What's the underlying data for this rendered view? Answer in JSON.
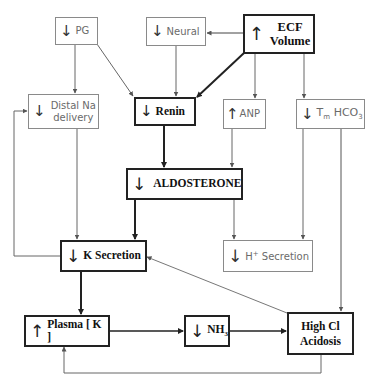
{
  "diagram": {
    "colors": {
      "bold_line": "#222222",
      "thin_line": "#7a7a7a",
      "thin_text": "#6a6a6a",
      "bold_text": "#111111",
      "background": "#ffffff"
    },
    "icons": {
      "arrow_down": "↓",
      "arrow_up": "↑"
    },
    "nodes": {
      "pg": {
        "direction": "down",
        "label": "PG"
      },
      "neural": {
        "direction": "down",
        "label": "Neural"
      },
      "ecf_volume": {
        "direction": "up",
        "label_line1": "ECF",
        "label_line2": "Volume"
      },
      "distal_na": {
        "direction": "down",
        "label_line1": "Distal Na",
        "label_line2": "delivery"
      },
      "renin": {
        "direction": "down",
        "label": "Renin"
      },
      "anp": {
        "direction": "up",
        "label": "ANP"
      },
      "tm_hco3": {
        "direction": "down",
        "label_prefix": "T",
        "label_sub": "m",
        "label_main": " HCO",
        "label_sub2": "3"
      },
      "aldosterone": {
        "direction": "down",
        "label": "ALDOSTERONE"
      },
      "k_secretion": {
        "direction": "down",
        "label": "K Secretion"
      },
      "h_secretion": {
        "direction": "down",
        "label_prefix": "H",
        "label_sup": "+",
        "label_main": " Secretion"
      },
      "plasma_k": {
        "direction": "up",
        "label": "Plasma [ K ]"
      },
      "nh3": {
        "direction": "down",
        "label_main": "NH",
        "label_sub": "3"
      },
      "high_cl_acidosis": {
        "label_line1": "High Cl",
        "label_line2": "Acidosis"
      }
    },
    "edges": [
      {
        "from": "ecf_volume",
        "to": "neural"
      },
      {
        "from": "ecf_volume",
        "to": "renin"
      },
      {
        "from": "ecf_volume",
        "to": "anp"
      },
      {
        "from": "ecf_volume",
        "to": "tm_hco3"
      },
      {
        "from": "pg",
        "to": "distal_na"
      },
      {
        "from": "pg",
        "to": "renin"
      },
      {
        "from": "neural",
        "to": "renin"
      },
      {
        "from": "renin",
        "to": "aldosterone"
      },
      {
        "from": "anp",
        "to": "aldosterone"
      },
      {
        "from": "distal_na",
        "to": "k_secretion"
      },
      {
        "from": "aldosterone",
        "to": "k_secretion"
      },
      {
        "from": "aldosterone",
        "to": "h_secretion"
      },
      {
        "from": "tm_hco3",
        "to": "h_secretion"
      },
      {
        "from": "tm_hco3",
        "to": "high_cl_acidosis"
      },
      {
        "from": "k_secretion",
        "to": "distal_na"
      },
      {
        "from": "k_secretion",
        "to": "plasma_k"
      },
      {
        "from": "high_cl_acidosis",
        "to": "k_secretion"
      },
      {
        "from": "plasma_k",
        "to": "nh3"
      },
      {
        "from": "nh3",
        "to": "high_cl_acidosis"
      },
      {
        "from": "high_cl_acidosis",
        "to": "plasma_k"
      }
    ]
  }
}
